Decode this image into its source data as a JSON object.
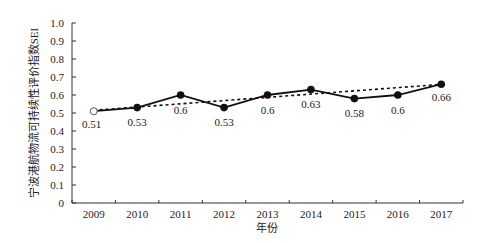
{
  "chart_data": {
    "type": "line",
    "title": "",
    "xlabel": "年份",
    "ylabel": "宁波港航物流可持续性评价指数SEI",
    "categories": [
      "2009",
      "2010",
      "2011",
      "2012",
      "2013",
      "2014",
      "2015",
      "2016",
      "2017"
    ],
    "series": [
      {
        "name": "SEI",
        "values": [
          0.51,
          0.53,
          0.6,
          0.53,
          0.6,
          0.63,
          0.58,
          0.6,
          0.66
        ],
        "style": "solid line with filled circle markers (first point open circle)"
      },
      {
        "name": "linear trend",
        "values": [
          0.515,
          0.533,
          0.551,
          0.569,
          0.587,
          0.605,
          0.623,
          0.641,
          0.659
        ],
        "style": "dotted line"
      }
    ],
    "data_labels": [
      "0.51",
      "0.53",
      "0.6",
      "0.53",
      "0.6",
      "0.63",
      "0.58",
      "0.6",
      "0.66"
    ],
    "ylim": [
      0,
      1.0
    ],
    "yticks": [
      "0",
      "0.1",
      "0.2",
      "0.3",
      "0.4",
      "0.5",
      "0.6",
      "0.7",
      "0.8",
      "0.9",
      "1.0"
    ],
    "grid": false,
    "legend": "none"
  }
}
